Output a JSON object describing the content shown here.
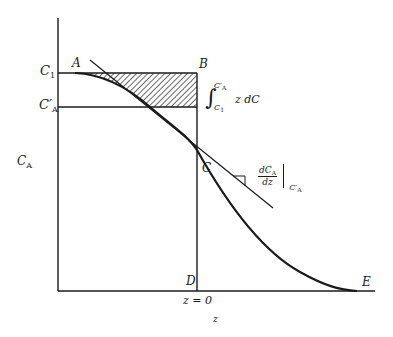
{
  "diagram": {
    "colors": {
      "stroke": "#1a1a1a",
      "hatch": "#1a1a1a",
      "background": "#ffffff"
    },
    "axes": {
      "y_label_main": "C",
      "y_label_sub": "A",
      "x_label": "z",
      "x_origin_label": "z = 0"
    },
    "y_ticks": {
      "c1_main": "C",
      "c1_sub": "1",
      "cprime_main": "C′",
      "cprime_sub": "A"
    },
    "points": {
      "A": "A",
      "B": "B",
      "C": "C",
      "D": "D",
      "E": "E"
    },
    "integral": {
      "symbol": "∫",
      "upper_main": "C′",
      "upper_sub": "A",
      "lower_main": "C",
      "lower_sub": "1",
      "integrand": "z dC"
    },
    "derivative": {
      "numerator_main": "dC",
      "numerator_sub": "A",
      "denominator": "dz",
      "eval_main": "C′",
      "eval_sub": "A"
    }
  }
}
